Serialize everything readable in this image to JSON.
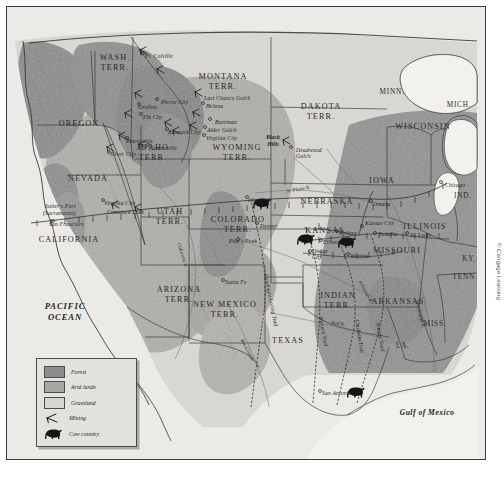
{
  "figure": {
    "credit": "© Cengage Learning"
  },
  "legend": {
    "items": [
      {
        "label": "Forest",
        "swatch": "#8d8d8d",
        "icon": "forest-swatch"
      },
      {
        "label": "Arid lands",
        "swatch": "#a9a7a2",
        "icon": "arid-swatch"
      },
      {
        "label": "Grassland",
        "swatch": "#d8d6d1",
        "icon": "grassland-swatch"
      },
      {
        "label": "Mining",
        "swatch": "",
        "icon": "mining-pick-icon"
      },
      {
        "label": "Cow country",
        "swatch": "",
        "icon": "cow-icon"
      }
    ]
  },
  "oceans": [
    {
      "name": "pacific-ocean",
      "label": "PACIFIC\nOCEAN"
    },
    {
      "name": "gulf-of-mexico",
      "label": "Gulf of Mexico"
    }
  ],
  "states": [
    {
      "label": "WASH.\nTERR.",
      "x": 108,
      "y": 52
    },
    {
      "label": "OREGON",
      "x": 72,
      "y": 118
    },
    {
      "label": "MONTANA\nTERR.",
      "x": 216,
      "y": 71
    },
    {
      "label": "DAKOTA\nTERR.",
      "x": 314,
      "y": 101
    },
    {
      "label": "MINN.",
      "x": 385,
      "y": 87
    },
    {
      "label": "WISCONSIN",
      "x": 416,
      "y": 121
    },
    {
      "label": "MICH.",
      "x": 452,
      "y": 100
    },
    {
      "label": "IDAHO\nTERR.",
      "x": 146,
      "y": 142
    },
    {
      "label": "WYOMING\nTERR.",
      "x": 230,
      "y": 142
    },
    {
      "label": "NEBRASKA",
      "x": 320,
      "y": 196
    },
    {
      "label": "IOWA",
      "x": 375,
      "y": 175
    },
    {
      "label": "ILLINOIS",
      "x": 418,
      "y": 221
    },
    {
      "label": "IND.",
      "x": 456,
      "y": 191
    },
    {
      "label": "NEVADA",
      "x": 81,
      "y": 173
    },
    {
      "label": "UTAH\nTERR.",
      "x": 163,
      "y": 206
    },
    {
      "label": "COLORADO\nTERR.",
      "x": 231,
      "y": 214
    },
    {
      "label": "KANSAS",
      "x": 318,
      "y": 225
    },
    {
      "label": "MISSOURI",
      "x": 390,
      "y": 245
    },
    {
      "label": "KY.",
      "x": 462,
      "y": 254
    },
    {
      "label": "CALIFORNIA",
      "x": 62,
      "y": 234
    },
    {
      "label": "ARIZONA\nTERR.",
      "x": 172,
      "y": 284
    },
    {
      "label": "NEW MEXICO\nTERR.",
      "x": 218,
      "y": 299
    },
    {
      "label": "INDIAN\nTERR.",
      "x": 331,
      "y": 290
    },
    {
      "label": "ARKANSAS",
      "x": 391,
      "y": 296
    },
    {
      "label": "TENN.",
      "x": 458,
      "y": 272
    },
    {
      "label": "MISS.",
      "x": 428,
      "y": 319
    },
    {
      "label": "LA.",
      "x": 396,
      "y": 341
    },
    {
      "label": "TEXAS",
      "x": 281,
      "y": 335
    }
  ],
  "towns": [
    {
      "label": "Ft. Colville",
      "x": 138,
      "y": 46
    },
    {
      "label": "Orofino",
      "x": 131,
      "y": 97
    },
    {
      "label": "Pierce City",
      "x": 154,
      "y": 92
    },
    {
      "label": "Elk City",
      "x": 136,
      "y": 107
    },
    {
      "label": "Bannack City",
      "x": 161,
      "y": 122
    },
    {
      "label": "Placerville",
      "x": 119,
      "y": 131
    },
    {
      "label": "Centerville",
      "x": 143,
      "y": 138
    },
    {
      "label": "Silver City",
      "x": 103,
      "y": 144
    },
    {
      "label": "Last Chance Gulch",
      "x": 197,
      "y": 88
    },
    {
      "label": "Helena",
      "x": 199,
      "y": 96
    },
    {
      "label": "Bozeman",
      "x": 208,
      "y": 112
    },
    {
      "label": "Alder Gulch",
      "x": 200,
      "y": 120
    },
    {
      "label": "Virginia City",
      "x": 199,
      "y": 128
    },
    {
      "label": "Deadwood\nGulch",
      "x": 289,
      "y": 140
    },
    {
      "label": "Virginia City",
      "x": 97,
      "y": 193
    },
    {
      "label": "Comstock Lode",
      "x": 100,
      "y": 202
    },
    {
      "label": "Sutter's Fort",
      "x": 38,
      "y": 196
    },
    {
      "label": "(Sacramento)",
      "x": 36,
      "y": 203
    },
    {
      "label": "San Francisco",
      "x": 42,
      "y": 214
    },
    {
      "label": "Cheyenne",
      "x": 241,
      "y": 190
    },
    {
      "label": "Denver",
      "x": 253,
      "y": 216
    },
    {
      "label": "Pike's Peak",
      "x": 222,
      "y": 231
    },
    {
      "label": "Omaha",
      "x": 366,
      "y": 194
    },
    {
      "label": "Chicago",
      "x": 438,
      "y": 175
    },
    {
      "label": "Kansas City",
      "x": 358,
      "y": 213
    },
    {
      "label": "Sedalia",
      "x": 372,
      "y": 224
    },
    {
      "label": "St. Louis",
      "x": 403,
      "y": 225
    },
    {
      "label": "Abilene",
      "x": 332,
      "y": 223
    },
    {
      "label": "Ellsworth",
      "x": 316,
      "y": 232
    },
    {
      "label": "Dodge\nCity",
      "x": 305,
      "y": 241
    },
    {
      "label": "Wichita",
      "x": 343,
      "y": 246
    },
    {
      "label": "Santa Fe",
      "x": 218,
      "y": 272
    },
    {
      "label": "San Antonio",
      "x": 315,
      "y": 383
    }
  ],
  "physiographic": [
    {
      "label": "Black\nHills",
      "x": 266,
      "y": 133
    }
  ],
  "rivers": [
    {
      "label": "N. Platte R.",
      "x": 279,
      "y": 181,
      "rotate": -10
    },
    {
      "label": "Arkansas R.",
      "x": 356,
      "y": 272,
      "rotate": 62
    },
    {
      "label": "Red R.",
      "x": 325,
      "y": 312,
      "rotate": 8
    },
    {
      "label": "Rio Grande",
      "x": 238,
      "y": 331,
      "rotate": 62
    },
    {
      "label": "Mississippi R.",
      "x": 413,
      "y": 292,
      "rotate": 76
    },
    {
      "label": "Colorado R.",
      "x": 175,
      "y": 235,
      "rotate": 72
    }
  ],
  "trails": [
    {
      "label": "Goodnight-Loving Trail",
      "x": 262,
      "y": 266,
      "rotate": 79
    },
    {
      "label": "Western Trail",
      "x": 317,
      "y": 309,
      "rotate": 80
    },
    {
      "label": "Chisholm Trail",
      "x": 353,
      "y": 312,
      "rotate": 81
    },
    {
      "label": "Sedalia Trail",
      "x": 374,
      "y": 315,
      "rotate": 80
    }
  ],
  "mining_sites": [
    {
      "x": 133,
      "y": 43
    },
    {
      "x": 150,
      "y": 62
    },
    {
      "x": 128,
      "y": 86
    },
    {
      "x": 118,
      "y": 106
    },
    {
      "x": 158,
      "y": 115
    },
    {
      "x": 166,
      "y": 123
    },
    {
      "x": 112,
      "y": 128
    },
    {
      "x": 132,
      "y": 137
    },
    {
      "x": 100,
      "y": 140
    },
    {
      "x": 188,
      "y": 85
    },
    {
      "x": 186,
      "y": 105
    },
    {
      "x": 183,
      "y": 118
    },
    {
      "x": 276,
      "y": 133
    },
    {
      "x": 105,
      "y": 197
    },
    {
      "x": 128,
      "y": 200
    }
  ],
  "cow_country_markers": [
    {
      "x": 253,
      "y": 196
    },
    {
      "x": 297,
      "y": 232
    },
    {
      "x": 338,
      "y": 235
    },
    {
      "x": 347,
      "y": 385
    }
  ]
}
